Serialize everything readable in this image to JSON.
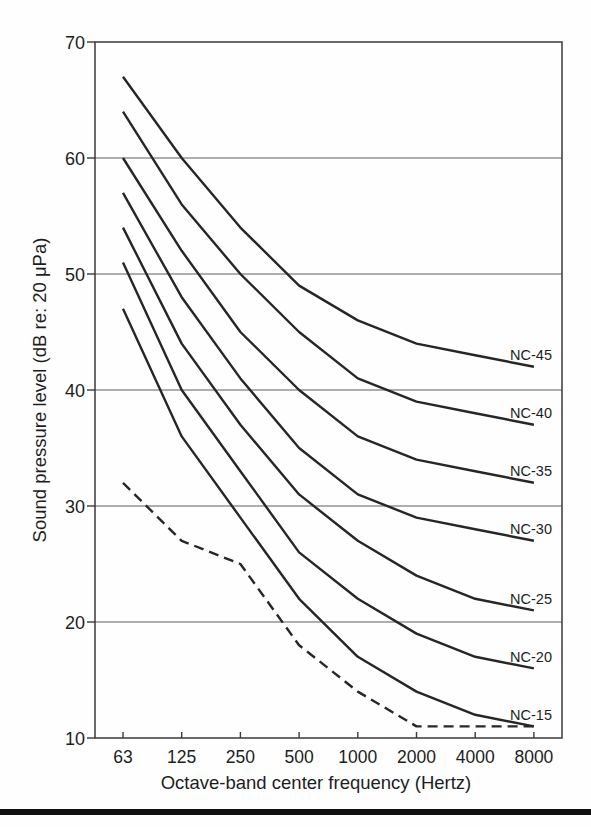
{
  "figure": {
    "bottom_rule_color": "#101010",
    "background": "#fefefe"
  },
  "chart_data": {
    "type": "line",
    "title": "",
    "xlabel": "Octave-band center frequency (Hertz)",
    "ylabel": "Sound pressure level (dB re: 20 μPa)",
    "x_categories": [
      "63",
      "125",
      "250",
      "500",
      "1000",
      "2000",
      "4000",
      "8000"
    ],
    "x_axis_scale": "octave-band (log2, evenly spaced ticks)",
    "y_ticks": [
      70,
      60,
      50,
      40,
      30,
      20,
      10
    ],
    "ylim": [
      10,
      70
    ],
    "grid": "horizontal gridlines at each 10 dB",
    "legend_position": "inline labels at right end of each curve",
    "series": [
      {
        "name": "NC-45",
        "label": "NC-45",
        "style": "solid",
        "values": [
          67,
          60,
          54,
          49,
          46,
          44,
          43,
          42
        ]
      },
      {
        "name": "NC-40",
        "label": "NC-40",
        "style": "solid",
        "values": [
          64,
          56,
          50,
          45,
          41,
          39,
          38,
          37
        ]
      },
      {
        "name": "NC-35",
        "label": "NC-35",
        "style": "solid",
        "values": [
          60,
          52,
          45,
          40,
          36,
          34,
          33,
          32
        ]
      },
      {
        "name": "NC-30",
        "label": "NC-30",
        "style": "solid",
        "values": [
          57,
          48,
          41,
          35,
          31,
          29,
          28,
          27
        ]
      },
      {
        "name": "NC-25",
        "label": "NC-25",
        "style": "solid",
        "values": [
          54,
          44,
          37,
          31,
          27,
          24,
          22,
          21
        ]
      },
      {
        "name": "NC-20",
        "label": "NC-20",
        "style": "solid",
        "values": [
          51,
          40,
          33,
          26,
          22,
          19,
          17,
          16
        ]
      },
      {
        "name": "NC-15",
        "label": "NC-15",
        "style": "solid",
        "values": [
          47,
          36,
          29,
          22,
          17,
          14,
          12,
          11
        ]
      },
      {
        "name": "hearing-threshold",
        "label": "",
        "style": "dashed",
        "values": [
          32,
          27,
          25,
          18,
          14,
          11,
          11,
          11
        ]
      }
    ],
    "colors": {
      "curve": "#262626",
      "grid": "#5f5f5f",
      "frame": "#3a3a3a",
      "text": "#1d1d1d"
    }
  }
}
